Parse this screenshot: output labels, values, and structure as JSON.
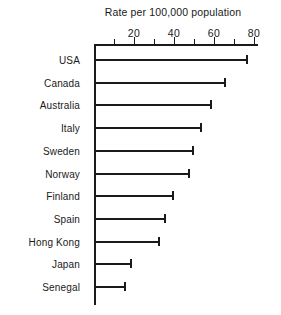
{
  "chart_data": {
    "type": "bar",
    "orientation": "horizontal",
    "title": "Rate per 100,000 population",
    "xlabel": "",
    "ylabel": "",
    "categories": [
      "USA",
      "Canada",
      "Australia",
      "Italy",
      "Sweden",
      "Norway",
      "Finland",
      "Spain",
      "Hong Kong",
      "Japan",
      "Senegal"
    ],
    "values": [
      77,
      66,
      59,
      54,
      50,
      48,
      40,
      36,
      33,
      19,
      16
    ],
    "xlim": [
      0,
      82
    ],
    "xticks_major": [
      20,
      40,
      60,
      80
    ],
    "xtick_labels": [
      "20",
      "40",
      "60",
      "80"
    ],
    "xticks_minor": [
      10,
      30,
      50,
      70
    ],
    "grid": false,
    "legend": null,
    "bar_color": "#1a1a1a",
    "axis_color": "#1a1a1a",
    "background": "#ffffff"
  }
}
